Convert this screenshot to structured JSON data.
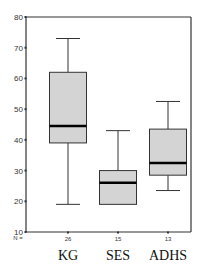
{
  "chart_data": {
    "type": "boxplot",
    "title": "",
    "xlabel": "",
    "ylabel": "",
    "ylim": [
      10,
      80
    ],
    "yticks": [
      10,
      20,
      30,
      40,
      50,
      60,
      70,
      80
    ],
    "grid": false,
    "categories": [
      "KG",
      "SES",
      "ADHS"
    ],
    "n_label": "N =",
    "n": [
      26,
      15,
      13
    ],
    "boxes": [
      {
        "name": "KG",
        "whisker_low": 19,
        "q1": 39,
        "median": 44.5,
        "q3": 62,
        "whisker_high": 73
      },
      {
        "name": "SES",
        "whisker_low": 19,
        "q1": 19,
        "median": 26,
        "q3": 30,
        "whisker_high": 43
      },
      {
        "name": "ADHS",
        "whisker_low": 23.5,
        "q1": 28.5,
        "median": 32.5,
        "q3": 43.5,
        "whisker_high": 52.5
      }
    ],
    "colors": {
      "box_fill": "#d4d4d4",
      "box_edge": "#333333",
      "median": "#000000",
      "axis": "#333333"
    }
  }
}
